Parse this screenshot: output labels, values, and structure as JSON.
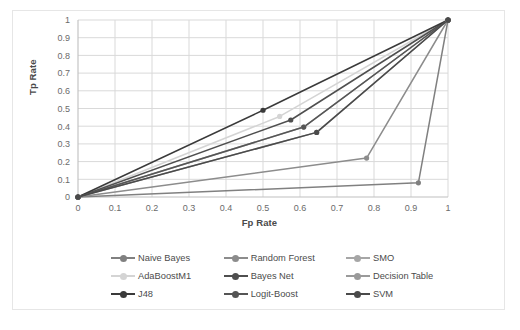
{
  "chart_data": {
    "type": "line",
    "title": "",
    "xlabel": "Fp Rate",
    "ylabel": "Tp Rate",
    "xlim": [
      0,
      1
    ],
    "ylim": [
      0,
      1
    ],
    "xticks": [
      "0",
      "0.1",
      "0.2",
      "0.3",
      "0.4",
      "0.5",
      "0.6",
      "0.7",
      "0.8",
      "0.9",
      "1"
    ],
    "yticks": [
      "0",
      "0.1",
      "0.2",
      "0.3",
      "0.4",
      "0.5",
      "0.6",
      "0.7",
      "0.8",
      "0.9",
      "1"
    ],
    "grid": true,
    "legend_position": "bottom",
    "marker": "circle",
    "series": [
      {
        "name": "Naive Bayes",
        "color": "#808080",
        "x": [
          0,
          0.92,
          1
        ],
        "y": [
          0,
          0.08,
          1
        ]
      },
      {
        "name": "Random Forest",
        "color": "#8c8c8c",
        "x": [
          0,
          0.78,
          1
        ],
        "y": [
          0,
          0.22,
          1
        ]
      },
      {
        "name": "SMO",
        "color": "#a6a6a6",
        "x": [
          0,
          0.61,
          1
        ],
        "y": [
          0,
          0.395,
          1
        ]
      },
      {
        "name": "AdaBoostM1",
        "color": "#d4d4d4",
        "x": [
          0,
          0.545,
          1
        ],
        "y": [
          0,
          0.455,
          1
        ]
      },
      {
        "name": "Bayes Net",
        "color": "#4f4f4f",
        "x": [
          0,
          0.575,
          1
        ],
        "y": [
          0,
          0.435,
          1
        ]
      },
      {
        "name": "Decision Table",
        "color": "#9a9a9a",
        "x": [
          0,
          0.645,
          1
        ],
        "y": [
          0,
          0.365,
          1
        ]
      },
      {
        "name": "J48",
        "color": "#3a3a3a",
        "x": [
          0,
          0.5,
          1
        ],
        "y": [
          0,
          0.49,
          1
        ]
      },
      {
        "name": "Logit-Boost",
        "color": "#555555",
        "x": [
          0,
          0.61,
          1
        ],
        "y": [
          0,
          0.395,
          1
        ]
      },
      {
        "name": "SVM",
        "color": "#4a4a4a",
        "x": [
          0,
          0.645,
          1
        ],
        "y": [
          0,
          0.365,
          1
        ]
      }
    ]
  },
  "legend": {
    "rows": [
      [
        "Naive Bayes",
        "Random Forest",
        "SMO"
      ],
      [
        "AdaBoostM1",
        "Bayes Net",
        "Decision Table"
      ],
      [
        "J48",
        "Logit-Boost",
        "SVM"
      ]
    ]
  },
  "colors": {
    "axis_text": "#6b6b6b",
    "grid": "#d9d9d9",
    "axis_line": "#bfbfbf",
    "frame": "#e6e6e6",
    "background": "#ffffff"
  }
}
